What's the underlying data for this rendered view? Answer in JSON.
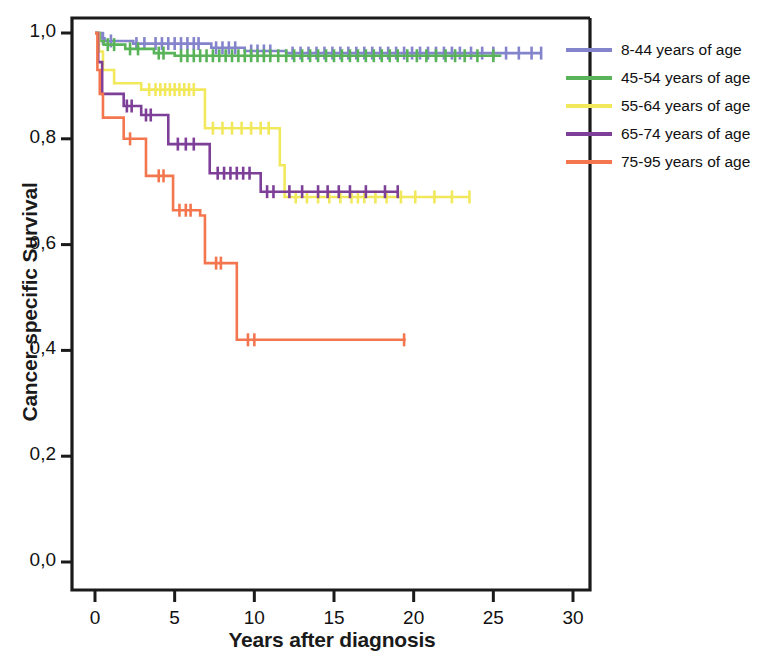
{
  "chart_data": {
    "type": "line",
    "title": "",
    "xlabel": "Years after diagnosis",
    "ylabel": "Cancer-specific Survival",
    "xlim": [
      0,
      31.5
    ],
    "ylim": [
      0,
      1.05
    ],
    "xticks": [
      "0",
      "5",
      "10",
      "15",
      "20",
      "25",
      "30"
    ],
    "xtick_values": [
      0,
      5,
      10,
      15,
      20,
      25,
      30
    ],
    "yticks": [
      "0,0",
      "0,2",
      "0,4",
      "0,6",
      "0,8",
      "1,0"
    ],
    "ytick_values": [
      0.0,
      0.2,
      0.4,
      0.6,
      0.8,
      1.0
    ],
    "grid": false,
    "legend_position": "right",
    "decimal_separator": ",",
    "plot_style": "kaplan-meier step with censor tick marks",
    "series": [
      {
        "name": "8-44 years of age",
        "color": "#8484cc",
        "points": [
          [
            0,
            1.0
          ],
          [
            0.35,
            0.99
          ],
          [
            0.6,
            0.985
          ],
          [
            2.1,
            0.985
          ],
          [
            2.4,
            0.98
          ],
          [
            6.9,
            0.98
          ],
          [
            7.3,
            0.972
          ],
          [
            9.0,
            0.972
          ],
          [
            9.4,
            0.966
          ],
          [
            11.5,
            0.966
          ],
          [
            12.0,
            0.962
          ],
          [
            28.0,
            0.962
          ]
        ],
        "censor_times": [
          0.5,
          1.0,
          2.6,
          3.1,
          3.8,
          4.2,
          4.6,
          5.0,
          5.4,
          5.8,
          6.2,
          6.5,
          7.6,
          8.0,
          8.4,
          8.8,
          9.8,
          10.2,
          10.6,
          11.0,
          12.4,
          12.9,
          13.4,
          13.9,
          14.4,
          14.9,
          15.4,
          15.9,
          16.4,
          16.9,
          17.4,
          17.9,
          18.4,
          18.9,
          19.4,
          19.9,
          20.4,
          20.9,
          21.4,
          21.9,
          22.4,
          22.9,
          23.6,
          24.3,
          25.0,
          25.8,
          26.6,
          27.4,
          28.0
        ]
      },
      {
        "name": "45-54 years of age",
        "color": "#59b359",
        "points": [
          [
            0,
            1.0
          ],
          [
            0.3,
            0.985
          ],
          [
            0.55,
            0.978
          ],
          [
            1.6,
            0.978
          ],
          [
            1.9,
            0.97
          ],
          [
            3.3,
            0.97
          ],
          [
            3.7,
            0.962
          ],
          [
            4.6,
            0.962
          ],
          [
            5.0,
            0.957
          ],
          [
            25.5,
            0.957
          ]
        ],
        "censor_times": [
          0.8,
          1.2,
          2.2,
          2.7,
          4.0,
          4.3,
          5.4,
          5.8,
          6.2,
          6.6,
          7.0,
          7.4,
          7.8,
          8.2,
          8.6,
          9.0,
          9.4,
          9.8,
          10.2,
          10.6,
          11.0,
          11.5,
          12.0,
          12.5,
          13.0,
          13.5,
          14.0,
          14.5,
          15.0,
          15.5,
          16.0,
          16.5,
          17.0,
          17.5,
          18.0,
          18.5,
          19.0,
          19.6,
          20.2,
          20.8,
          21.4,
          22.0,
          22.6,
          23.2,
          24.0,
          25.0
        ]
      },
      {
        "name": "55-64 years of age",
        "color": "#f2e85c",
        "points": [
          [
            0,
            1.0
          ],
          [
            0.25,
            0.965
          ],
          [
            0.5,
            0.93
          ],
          [
            0.95,
            0.93
          ],
          [
            1.2,
            0.905
          ],
          [
            2.6,
            0.905
          ],
          [
            2.9,
            0.893
          ],
          [
            6.6,
            0.893
          ],
          [
            6.9,
            0.82
          ],
          [
            11.3,
            0.82
          ],
          [
            11.6,
            0.75
          ],
          [
            11.9,
            0.69
          ],
          [
            23.5,
            0.69
          ]
        ],
        "censor_times": [
          3.4,
          3.8,
          4.1,
          4.4,
          4.7,
          5.0,
          5.3,
          5.6,
          5.9,
          6.2,
          7.4,
          8.0,
          8.6,
          9.2,
          9.8,
          10.4,
          10.9,
          12.6,
          13.3,
          14.0,
          14.7,
          15.4,
          16.1,
          16.5,
          16.9,
          17.6,
          18.3,
          19.2,
          20.1,
          21.3,
          22.4,
          23.5
        ]
      },
      {
        "name": "65-74 years of age",
        "color": "#7d3f98",
        "points": [
          [
            0,
            1.0
          ],
          [
            0.2,
            0.945
          ],
          [
            0.45,
            0.885
          ],
          [
            1.5,
            0.885
          ],
          [
            1.8,
            0.862
          ],
          [
            2.6,
            0.862
          ],
          [
            2.9,
            0.845
          ],
          [
            4.3,
            0.845
          ],
          [
            4.6,
            0.79
          ],
          [
            6.9,
            0.79
          ],
          [
            7.2,
            0.735
          ],
          [
            10.1,
            0.735
          ],
          [
            10.4,
            0.7
          ],
          [
            19.0,
            0.7
          ]
        ],
        "censor_times": [
          2.0,
          2.3,
          3.2,
          3.5,
          5.2,
          5.7,
          6.2,
          7.7,
          8.1,
          8.5,
          8.9,
          9.3,
          9.7,
          10.8,
          11.2,
          12.2,
          13.0,
          14.0,
          14.6,
          15.3,
          16.0,
          17.0,
          18.2,
          19.0
        ]
      },
      {
        "name": "75-95 years of age",
        "color": "#f4764f",
        "points": [
          [
            0,
            1.0
          ],
          [
            0.15,
            0.93
          ],
          [
            0.3,
            0.885
          ],
          [
            0.5,
            0.84
          ],
          [
            1.5,
            0.84
          ],
          [
            1.8,
            0.8
          ],
          [
            2.9,
            0.8
          ],
          [
            3.2,
            0.73
          ],
          [
            4.6,
            0.73
          ],
          [
            4.9,
            0.665
          ],
          [
            6.3,
            0.665
          ],
          [
            6.6,
            0.655
          ],
          [
            6.9,
            0.565
          ],
          [
            8.6,
            0.565
          ],
          [
            8.9,
            0.42
          ],
          [
            19.5,
            0.42
          ]
        ],
        "censor_times": [
          2.2,
          4.0,
          4.3,
          5.3,
          5.7,
          6.0,
          7.6,
          7.9,
          9.6,
          10.0,
          19.4
        ]
      }
    ]
  },
  "axes": {
    "y_title": "Cancer-specific Survival",
    "x_title": "Years after diagnosis"
  },
  "legend": {
    "items": [
      {
        "label": "8-44 years of age",
        "color": "#8484cc"
      },
      {
        "label": "45-54 years of age",
        "color": "#59b359"
      },
      {
        "label": "55-64 years of age",
        "color": "#f2e85c"
      },
      {
        "label": "65-74 years of age",
        "color": "#7d3f98"
      },
      {
        "label": "75-95 years of age",
        "color": "#f4764f"
      }
    ]
  }
}
